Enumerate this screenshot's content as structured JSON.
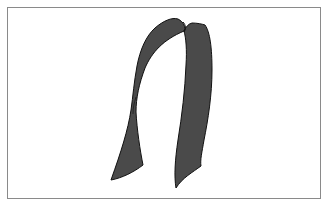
{
  "figure": {
    "colors": {
      "background": "#ffffff",
      "frame_border": "#8a8a8a",
      "strap_fill": "#4a4a4a",
      "strap_outline": "#111111"
    }
  }
}
